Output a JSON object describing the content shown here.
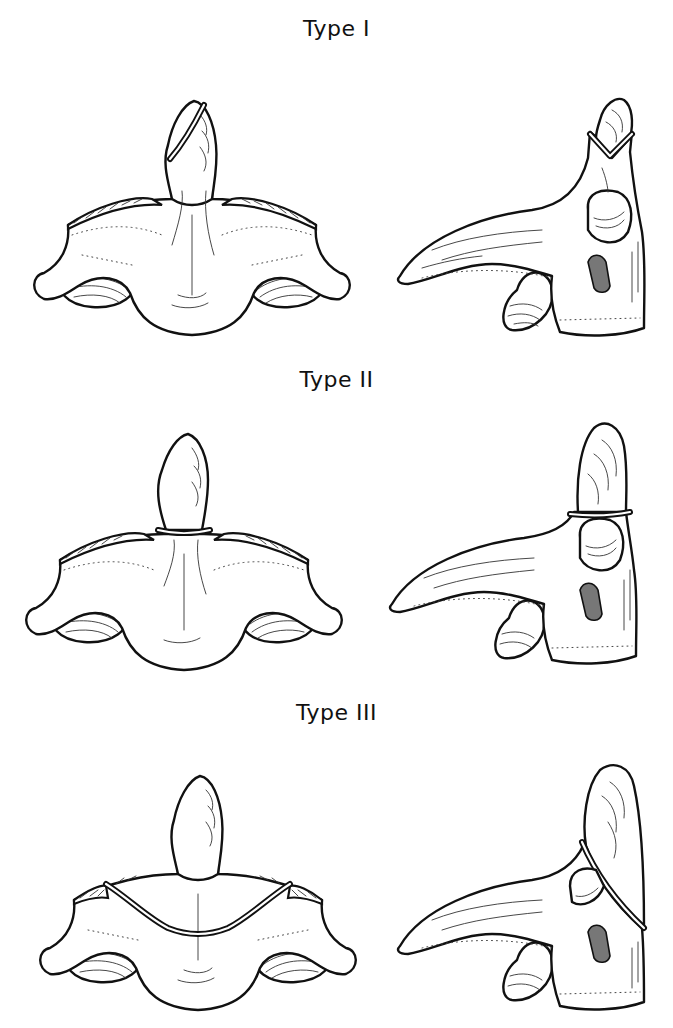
{
  "figure": {
    "rows": [
      {
        "label": "Type I",
        "fracture_level": "tip-of-dens",
        "views": [
          "anterior-view",
          "lateral-view"
        ]
      },
      {
        "label": "Type II",
        "fracture_level": "base-of-dens",
        "views": [
          "anterior-view",
          "lateral-view"
        ]
      },
      {
        "label": "Type III",
        "fracture_level": "vertebral-body",
        "views": [
          "anterior-view",
          "lateral-view"
        ]
      }
    ]
  },
  "colors": {
    "line": "#111111",
    "background": "#ffffff"
  }
}
